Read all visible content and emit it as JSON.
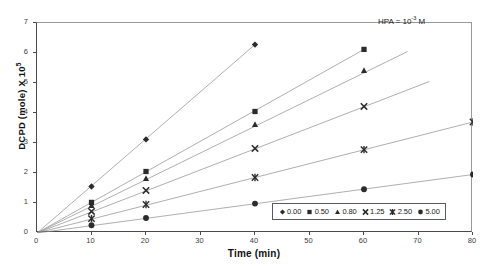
{
  "chart_data": {
    "type": "scatter",
    "title": "",
    "xlabel": "Time (min)",
    "ylabel_text": "DCPD (mole) X 10",
    "ylabel_sup": "5",
    "xlim": [
      0,
      80
    ],
    "ylim": [
      0,
      7
    ],
    "xticks": [
      0,
      10,
      20,
      30,
      40,
      50,
      60,
      70,
      80
    ],
    "yticks": [
      0,
      1,
      2,
      3,
      4,
      5,
      6,
      7
    ],
    "grid": false,
    "legend_position": "bottom-right",
    "annotation": {
      "text_before": "HPA = 10",
      "superscript": "-3",
      "text_after": " M"
    },
    "series": [
      {
        "name": "0.00",
        "marker": "diamond",
        "color": "#2b2b2b",
        "x": [
          0,
          10,
          20,
          40
        ],
        "y": [
          0.0,
          1.55,
          3.12,
          6.28
        ],
        "trend_to": {
          "x": 40,
          "y": 6.28
        }
      },
      {
        "name": "0.50",
        "marker": "square",
        "color": "#2b2b2b",
        "x": [
          0,
          10,
          20,
          40,
          60
        ],
        "y": [
          0.0,
          1.02,
          2.05,
          4.05,
          6.12
        ],
        "trend_to": {
          "x": 60,
          "y": 6.12
        }
      },
      {
        "name": "0.80",
        "marker": "triangle",
        "color": "#2b2b2b",
        "x": [
          0,
          10,
          20,
          40,
          60
        ],
        "y": [
          0.0,
          0.92,
          1.82,
          3.62,
          5.42
        ],
        "trend_to": {
          "x": 68,
          "y": 6.05
        }
      },
      {
        "name": "1.25",
        "marker": "cross",
        "color": "#2b2b2b",
        "x": [
          0,
          10,
          20,
          40,
          60
        ],
        "y": [
          0.0,
          0.72,
          1.42,
          2.82,
          4.22
        ],
        "trend_to": {
          "x": 72,
          "y": 5.05
        }
      },
      {
        "name": "2.50",
        "marker": "asterisk",
        "color": "#2b2b2b",
        "x": [
          0,
          10,
          20,
          40,
          60,
          80
        ],
        "y": [
          0.0,
          0.48,
          0.95,
          1.85,
          2.78,
          3.7
        ],
        "trend_to": {
          "x": 80,
          "y": 3.7
        }
      },
      {
        "name": "5.00",
        "marker": "circle",
        "color": "#2b2b2b",
        "x": [
          0,
          10,
          20,
          40,
          60,
          80
        ],
        "y": [
          0.0,
          0.26,
          0.5,
          0.98,
          1.46,
          1.95
        ],
        "trend_to": {
          "x": 80,
          "y": 1.95
        }
      }
    ],
    "legend_entries": [
      {
        "label": "0.00",
        "marker": "diamond"
      },
      {
        "label": "0.50",
        "marker": "square"
      },
      {
        "label": "0.80",
        "marker": "triangle"
      },
      {
        "label": "1.25",
        "marker": "cross"
      },
      {
        "label": "2.50",
        "marker": "asterisk"
      },
      {
        "label": "5.00",
        "marker": "circle"
      }
    ]
  }
}
